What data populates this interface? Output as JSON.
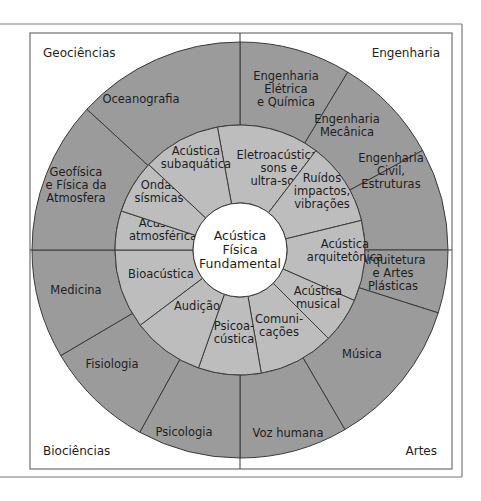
{
  "colors": {
    "outer_ring": "#9b9b9b",
    "middle_ring": "#bdbdbd",
    "center": "#ffffff",
    "lines": "#3a3a3a",
    "frame": "#6f6f6f"
  },
  "corners": {
    "top_left": "Geociências",
    "top_right": "Engenharia",
    "bottom_left": "Biociências",
    "bottom_right": "Artes"
  },
  "center": {
    "lines": [
      "Acústica",
      "Física",
      "Fundamental"
    ]
  },
  "middle_ring": [
    {
      "lines": [
        "Eletroacústica,",
        "sons e",
        "ultra-sons"
      ]
    },
    {
      "lines": [
        "Ruídos",
        "impactos,",
        "vibrações"
      ]
    },
    {
      "lines": [
        "Acústica",
        "arquitetônica"
      ]
    },
    {
      "lines": [
        "Acústica",
        "musical"
      ]
    },
    {
      "lines": [
        "Comuni-",
        "cações"
      ]
    },
    {
      "lines": [
        "Psicoa-",
        "cústica"
      ]
    },
    {
      "lines": [
        "Audição"
      ]
    },
    {
      "lines": [
        "Bioacústica"
      ]
    },
    {
      "lines": [
        "Acústica",
        "atmosférica"
      ]
    },
    {
      "lines": [
        "Ondas",
        "sísmicas"
      ]
    },
    {
      "lines": [
        "Acústica",
        "subaquática"
      ]
    }
  ],
  "outer_ring": [
    {
      "lines": [
        "Engenharia",
        "Elétrica",
        "e Química"
      ]
    },
    {
      "lines": [
        "Engenharia",
        "Mecânica"
      ]
    },
    {
      "lines": [
        "Engenharia",
        "Civil,",
        "Estruturas"
      ]
    },
    {
      "lines": [
        "Arquitetura",
        "e Artes",
        "Plásticas"
      ]
    },
    {
      "lines": [
        "Música"
      ]
    },
    {
      "lines": [
        "Voz humana"
      ]
    },
    {
      "lines": [
        "Psicologia"
      ]
    },
    {
      "lines": [
        "Fisiologia"
      ]
    },
    {
      "lines": [
        "Medicina"
      ]
    },
    {
      "lines": [
        "Geofísica",
        "e Física da",
        "Atmosfera"
      ]
    },
    {
      "lines": [
        "Oceanografia"
      ]
    }
  ]
}
